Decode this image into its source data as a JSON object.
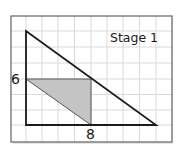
{
  "figure": {
    "title": "Stage 1",
    "labels": {
      "vertical_side": "6",
      "horizontal_side": "8"
    },
    "colors": {
      "background": "#ffffff",
      "grid": "#d9d9d9",
      "border": "#6e6e6e",
      "outline": "#1a1a1a",
      "shade": "#c4c4c4"
    },
    "grid": {
      "cell_width": 16.25,
      "cell_height": 15.6,
      "columns": 10,
      "rows": 8
    },
    "large_triangle": {
      "vertices": [
        [
          26,
          31
        ],
        [
          26,
          125
        ],
        [
          156,
          125
        ]
      ]
    },
    "shaded_triangle": {
      "vertices": [
        [
          26,
          79
        ],
        [
          91,
          79
        ],
        [
          91,
          125
        ]
      ]
    }
  }
}
